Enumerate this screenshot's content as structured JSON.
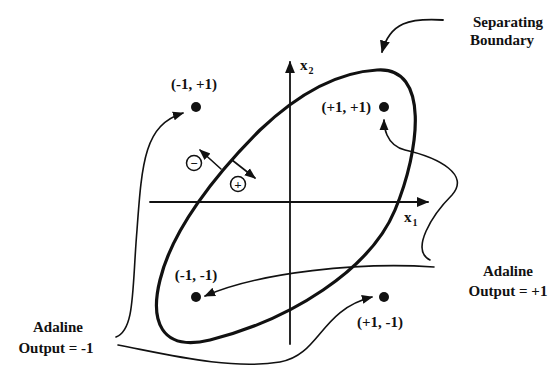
{
  "diagram": {
    "axes": {
      "x1_label": "x",
      "x1_sub": "1",
      "x2_label": "x",
      "x2_sub": "2"
    },
    "points": [
      {
        "label": "(-1, +1)",
        "x": -1,
        "y": 1
      },
      {
        "label": "(+1, +1)",
        "x": 1,
        "y": 1
      },
      {
        "label": "(-1, -1)",
        "x": -1,
        "y": -1
      },
      {
        "label": "(+1, -1)",
        "x": 1,
        "y": -1
      }
    ],
    "region_markers": {
      "minus": "−",
      "plus": "+"
    },
    "annotations": {
      "boundary_line1": "Separating",
      "boundary_line2": "Boundary",
      "out_pos_line1": "Adaline",
      "out_pos_line2": "Output = +1",
      "out_neg_line1": "Adaline",
      "out_neg_line2": "Output = -1"
    },
    "colors": {
      "ink": "#111111",
      "background": "#ffffff"
    }
  }
}
